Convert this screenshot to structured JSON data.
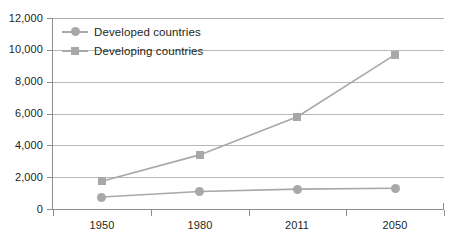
{
  "chart_data": {
    "type": "line",
    "title": "",
    "subtitle": "",
    "xlabel": "",
    "ylabel": "",
    "categories": [
      "1950",
      "1980",
      "2011",
      "2050"
    ],
    "series": [
      {
        "name": "Developed countries",
        "marker": "circle",
        "color": "#a8a8a8",
        "values": [
          750,
          1100,
          1250,
          1300
        ]
      },
      {
        "name": "Developing countries",
        "marker": "square",
        "color": "#a8a8a8",
        "values": [
          1750,
          3400,
          5800,
          9700
        ]
      }
    ],
    "ylim": [
      0,
      12000
    ],
    "yticks": [
      0,
      2000,
      4000,
      6000,
      8000,
      10000,
      12000
    ],
    "ytick_labels": [
      "0",
      "2,000",
      "4,000",
      "6,000",
      "8,000",
      "10,000",
      "12,000"
    ],
    "grid": true,
    "legend_position": "top-left"
  },
  "legend": {
    "items": [
      {
        "label": "Developed countries",
        "marker": "circle"
      },
      {
        "label": "Developing countries",
        "marker": "square"
      }
    ]
  },
  "colors": {
    "series": "#a8a8a8",
    "gridline": "#b9b9b9",
    "axis": "#8d8d8d",
    "text": "#231f20",
    "background": "#ffffff"
  }
}
